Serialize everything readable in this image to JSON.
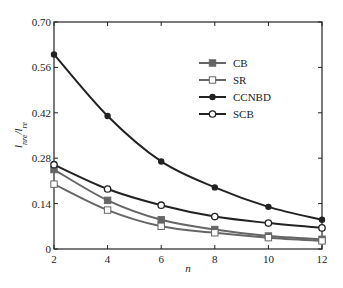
{
  "chart_data": {
    "type": "line",
    "title": "",
    "xlabel": "n",
    "ylabel": "l_{nre}/l_{re}",
    "x": [
      2,
      4,
      6,
      8,
      10,
      12
    ],
    "xlim": [
      2,
      12
    ],
    "ylim": [
      0,
      0.7
    ],
    "xticks": [
      "2",
      "4",
      "6",
      "8",
      "10",
      "12"
    ],
    "yticks": [
      "0",
      "0.14",
      "0.28",
      "0.42",
      "0.56",
      "0.70"
    ],
    "grid": false,
    "legend_position": "upper right",
    "series": [
      {
        "name": "CB",
        "marker": "filled-square",
        "color": "#666666",
        "values": [
          0.245,
          0.15,
          0.09,
          0.06,
          0.04,
          0.03
        ]
      },
      {
        "name": "SR",
        "marker": "open-square",
        "color": "#666666",
        "values": [
          0.2,
          0.12,
          0.07,
          0.05,
          0.035,
          0.025
        ]
      },
      {
        "name": "CCNBD",
        "marker": "filled-circle",
        "color": "#222222",
        "values": [
          0.6,
          0.41,
          0.27,
          0.19,
          0.13,
          0.09
        ]
      },
      {
        "name": "SCB",
        "marker": "open-circle",
        "color": "#222222",
        "values": [
          0.26,
          0.185,
          0.135,
          0.1,
          0.08,
          0.065
        ]
      }
    ]
  }
}
